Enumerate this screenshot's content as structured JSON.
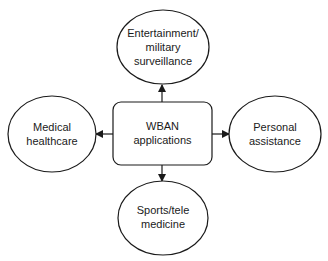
{
  "diagram": {
    "center": {
      "lines": [
        "WBAN",
        "applications"
      ]
    },
    "nodes": {
      "top": {
        "lines": [
          "Entertainment/",
          "military",
          "surveillance"
        ]
      },
      "left": {
        "lines": [
          "Medical",
          "healthcare"
        ]
      },
      "right": {
        "lines": [
          "Personal",
          "assistance"
        ]
      },
      "bottom": {
        "lines": [
          "Sports/tele",
          "medicine"
        ]
      }
    },
    "colors": {
      "stroke": "#1a1a1a",
      "fill": "#ffffff"
    }
  }
}
